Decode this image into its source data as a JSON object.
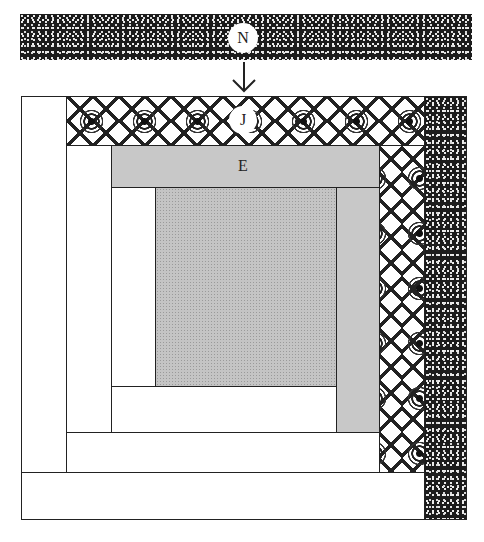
{
  "diagram": {
    "type": "log-cabin quilt block assembly",
    "strips": {
      "N": {
        "label": "N",
        "fabric": "dark speckled"
      },
      "J": {
        "label": "J",
        "fabric": "black-and-white lace/floral"
      },
      "E": {
        "label": "E",
        "fabric": "light gray"
      }
    },
    "arrow": {
      "direction": "down",
      "meaning": "attach strip N to top of block"
    },
    "colors": {
      "dark_fabric": "#1c1c1c",
      "light_gray": "#c8c8c8",
      "center_gray": "#c4c4c4",
      "white": "#ffffff",
      "outline": "#222222"
    }
  }
}
